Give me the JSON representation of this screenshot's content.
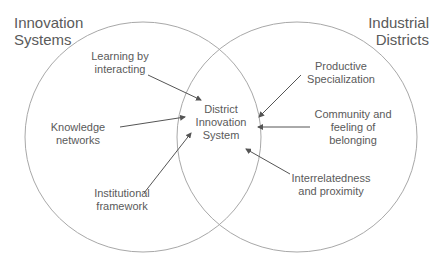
{
  "titles": {
    "left": "Innovation\nSystems",
    "right": "Industrial\nDistricts"
  },
  "center": "District\nInnovation\nSystem",
  "left_factors": [
    {
      "label": "Learning by\ninteracting"
    },
    {
      "label": "Knowledge\nnetworks"
    },
    {
      "label": "Institutional\nframework"
    }
  ],
  "right_factors": [
    {
      "label": "Productive\nSpecialization"
    },
    {
      "label": "Community and\nfeeling of\nbelonging"
    },
    {
      "label": "Interrelatedness\nand proximity"
    }
  ],
  "colors": {
    "line": "#9a9a9a",
    "arrow": "#555555",
    "text": "#5a5a5a"
  }
}
